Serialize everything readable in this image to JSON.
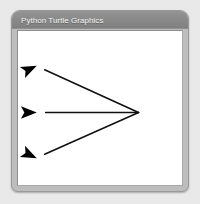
{
  "window": {
    "title": "Python Turtle Graphics",
    "background_color": "#e9e9e9",
    "titlebar_color": "#8a8a8a",
    "titlebar_text_color": "#f4f4f4",
    "border_color": "#9a9a9a",
    "canvas_color": "#ffffff"
  },
  "drawing": {
    "name": "turtle-arrow-fan",
    "stroke_color": "#111111",
    "stroke_width": 1.6,
    "pen_color": "#000000",
    "origin": {
      "x": 139,
      "y": 113
    },
    "turtles": [
      {
        "name": "turtle-top",
        "tip": {
          "x": 36,
          "y": 66
        },
        "angle_deg": 155,
        "line_from": {
          "x": 139,
          "y": 113
        },
        "line_to": {
          "x": 44,
          "y": 70
        }
      },
      {
        "name": "turtle-middle",
        "tip": {
          "x": 36,
          "y": 113
        },
        "angle_deg": 180,
        "line_from": {
          "x": 139,
          "y": 113
        },
        "line_to": {
          "x": 45,
          "y": 113
        }
      },
      {
        "name": "turtle-bottom",
        "tip": {
          "x": 36,
          "y": 159
        },
        "angle_deg": 205,
        "line_from": {
          "x": 139,
          "y": 113
        },
        "line_to": {
          "x": 44,
          "y": 155
        }
      }
    ]
  }
}
